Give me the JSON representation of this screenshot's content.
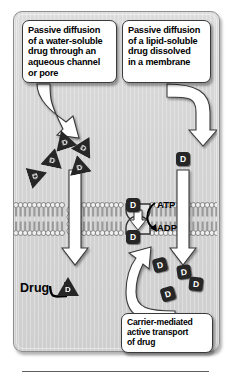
{
  "figure": {
    "panel_bg": "#d6d6d6",
    "panel_border": "#8e8e8e",
    "marker_color": "#262626",
    "arrow_fill": "#ffffff",
    "arrow_stroke": "#3a3a3a"
  },
  "callouts": {
    "water_soluble": {
      "name": "passive-diffusion-water-soluble",
      "lines": [
        "Passive diffusion",
        "of a water-soluble",
        "drug through an",
        "aqueous channel",
        "or pore"
      ]
    },
    "lipid_soluble": {
      "name": "passive-diffusion-lipid-soluble",
      "lines": [
        "Passive diffusion",
        "of a lipid-soluble",
        "drug dissolved",
        "in a membrane"
      ]
    },
    "carrier_mediated": {
      "name": "carrier-mediated-active-transport",
      "lines": [
        "Carrier-mediated",
        "active transport",
        "of drug"
      ]
    }
  },
  "labels": {
    "atp": "ATP",
    "adp": "ADP",
    "drug": "Drug"
  },
  "markers": {
    "triangle_label": "D",
    "square_label": "D",
    "triangles": [
      {
        "x": 53,
        "y": 130,
        "rot": -18
      },
      {
        "x": 74,
        "y": 136,
        "rot": 28
      },
      {
        "x": 42,
        "y": 148,
        "rot": 12
      },
      {
        "x": 68,
        "y": 155,
        "rot": -12
      },
      {
        "x": 27,
        "y": 166,
        "rot": 72
      },
      {
        "x": 57,
        "y": 277,
        "rot": 0
      }
    ],
    "squares": [
      {
        "x": 176,
        "y": 152,
        "rot": 0
      },
      {
        "x": 126,
        "y": 198,
        "rot": 0
      },
      {
        "x": 126,
        "y": 230,
        "rot": 0
      },
      {
        "x": 177,
        "y": 265,
        "rot": -8
      },
      {
        "x": 153,
        "y": 258,
        "rot": -14
      },
      {
        "x": 189,
        "y": 277,
        "rot": 6
      },
      {
        "x": 161,
        "y": 287,
        "rot": -16
      }
    ]
  },
  "membrane": {
    "name": "lipid-bilayer",
    "y_top": 205,
    "y_bottom": 233,
    "head_color": "#f0f0f0",
    "head_stroke": "#6a6a6a",
    "tail_color": "#9a9a9a",
    "pore_x": 74,
    "carrier_x": 136
  }
}
